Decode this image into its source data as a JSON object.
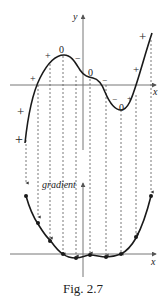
{
  "figure": {
    "caption": "Fig. 2.7",
    "top_graph": {
      "y_axis_label": "y",
      "x_axis_label": "x",
      "sign_labels": [
        "+",
        "+",
        "+",
        "0",
        "−",
        "0",
        "−",
        "−",
        "0",
        "+",
        "+",
        "+",
        "+"
      ]
    },
    "bottom_graph": {
      "y_axis_label": "gradient",
      "x_axis_label": "x"
    },
    "colors": {
      "curve": "#1a1a1a",
      "axis": "#777777",
      "dashed": "#555555"
    }
  }
}
